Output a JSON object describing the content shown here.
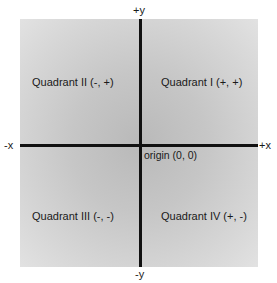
{
  "diagram": {
    "type": "cartesian-coordinate-plane",
    "axes": {
      "positive_y": "+y",
      "negative_y": "-y",
      "negative_x": "-x",
      "positive_x": "+x"
    },
    "origin_label": "origin (0, 0)",
    "quadrants": {
      "q1": "Quadrant I (+, +)",
      "q2": "Quadrant II (-, +)",
      "q3": "Quadrant III (-, -)",
      "q4": "Quadrant IV (+, -)"
    },
    "colors": {
      "plane_center": "#b9b9b9",
      "plane_edge": "#e2e2e2",
      "axis": "#111111",
      "text": "#1a1a1a",
      "background": "#ffffff"
    }
  }
}
